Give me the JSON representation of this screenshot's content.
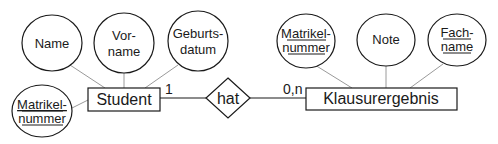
{
  "diagram": {
    "type": "er-diagram",
    "entities": [
      {
        "id": "student",
        "label": "Student"
      },
      {
        "id": "klausurergebnis",
        "label": "Klausurergebnis"
      }
    ],
    "relationship": {
      "label": "hat",
      "card_left": "1",
      "card_right": "0,n"
    },
    "student_attributes": [
      {
        "line1": "Name",
        "line2": "",
        "key": false
      },
      {
        "line1": "Vor-",
        "line2": "name",
        "key": false
      },
      {
        "line1": "Geburts-",
        "line2": "datum",
        "key": false
      },
      {
        "line1": "Matrikel-",
        "line2": "nummer",
        "key": true
      }
    ],
    "klausur_attributes": [
      {
        "line1": "Matrikel-",
        "line2": "nummer",
        "key": true
      },
      {
        "line1": "Note",
        "line2": "",
        "key": false
      },
      {
        "line1": "Fach-",
        "line2": "name",
        "key": true
      }
    ]
  },
  "colors": {
    "stroke": "#1a1a1a",
    "connector": "#999999"
  }
}
